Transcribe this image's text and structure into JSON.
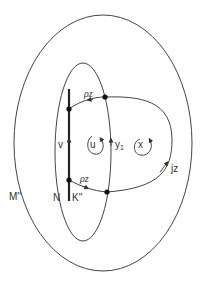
{
  "diagram": {
    "colors": {
      "line": "#444444",
      "text": "#333333",
      "background": "#ffffff"
    },
    "regions": {
      "outer": {
        "label": "M''"
      },
      "inner": {
        "label": "N"
      }
    },
    "segment": {
      "label": "K''",
      "points": [
        "top",
        "bottom"
      ]
    },
    "arcs": {
      "top": {
        "label": "ρz"
      },
      "bottom": {
        "label": "ρz"
      },
      "right": {
        "label": "jz"
      }
    },
    "edge_labels": {
      "v": "v",
      "y1_base": "y",
      "y1_sub": "1"
    },
    "loops": {
      "u": {
        "label": "u"
      },
      "x": {
        "label": "x"
      }
    }
  }
}
